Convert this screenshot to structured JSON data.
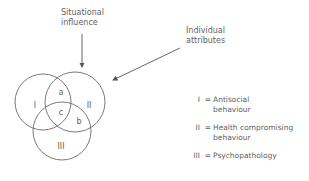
{
  "diagram": {
    "situational_label": [
      "Situational",
      "influence"
    ],
    "individual_label": [
      "Individual",
      "attributes"
    ],
    "circles": [
      {
        "id": "I",
        "label": "I",
        "cx": 43,
        "cy": 102,
        "r": 28
      },
      {
        "id": "II",
        "label": "II",
        "cx": 75,
        "cy": 102,
        "r": 30
      },
      {
        "id": "III",
        "label": "III",
        "cx": 62,
        "cy": 131,
        "r": 29
      }
    ],
    "regions": {
      "a": "a",
      "b": "b",
      "c": "c"
    },
    "stroke_color": "#6b6b6b"
  },
  "legend": [
    {
      "numeral": "I",
      "eq": "=",
      "line1": "Antisocial",
      "line2": "behaviour"
    },
    {
      "numeral": "II",
      "eq": "=",
      "line1": "Health compromising",
      "line2": "behaviour"
    },
    {
      "numeral": "III",
      "eq": "=",
      "line1": "Psychopathology",
      "line2": ""
    }
  ]
}
